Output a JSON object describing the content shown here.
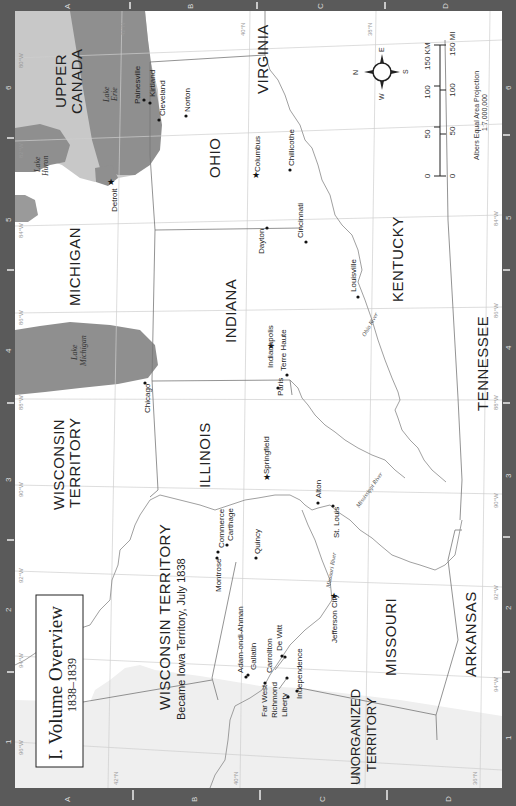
{
  "map": {
    "title": "I. Volume Overview",
    "subtitle": "1838–1839",
    "orientation": "rotated 90° counter-clockwise (north to the left)",
    "colors": {
      "frame": "#5a5a5a",
      "canada_land": "#c8c8c8",
      "water": "#8f8f8f",
      "land": "#ffffff",
      "unorganized": "#efefef",
      "grid": "#cfcfcf",
      "border": "#777777"
    },
    "frame": {
      "rows": [
        "A",
        "B",
        "C",
        "D"
      ],
      "columns": [
        "1",
        "2",
        "3",
        "4",
        "5",
        "6"
      ]
    },
    "regions": {
      "upper_canada": "UPPER CANADA",
      "michigan": "MICHIGAN",
      "ohio": "OHIO",
      "virginia": "VIRGINIA",
      "indiana": "INDIANA",
      "kentucky": "KENTUCKY",
      "tennessee": "TENNESSEE",
      "illinois": "ILLINOIS",
      "wisconsin_1": "WISCONSIN",
      "wisconsin_2": "TERRITORY",
      "iowa_1": "WISCONSIN TERRITORY",
      "iowa_2": "Became Iowa Territory, July 1838",
      "missouri": "MISSOURI",
      "arkansas": "ARKANSAS",
      "unorganized_1": "UNORGANIZED",
      "unorganized_2": "TERRITORY"
    },
    "water_labels": {
      "lake_huron_1": "Lake",
      "lake_huron_2": "Huron",
      "lake_erie_1": "Lake",
      "lake_erie_2": "Erie",
      "lake_michigan_1": "Lake",
      "lake_michigan_2": "Michigan",
      "ohio_river": "Ohio River",
      "mississippi_river": "Mississippi River",
      "missouri_river": "Missouri River"
    },
    "cities": {
      "painesville": "Painesville",
      "kirtland": "Kirtland",
      "cleveland": "Cleveland",
      "norton": "Norton",
      "detroit": "Detroit",
      "columbus": "Columbus",
      "chillicothe": "Chillicothe",
      "dayton": "Dayton",
      "cincinnati": "Cincinnati",
      "louisville": "Louisville",
      "indianapolis": "Indianapolis",
      "terre_haute": "Terre Haute",
      "paris": "Paris",
      "chicago": "Chicago",
      "springfield": "Springfield",
      "alton": "Alton",
      "st_louis": "St. Louis",
      "commerce": "Commerce",
      "carthage": "Carthage",
      "montrose": "Montrose",
      "quincy": "Quincy",
      "jefferson_city": "Jefferson City",
      "adam_ondi_ahman": "Adam-ondi-Ahman",
      "gallatin": "Gallatin",
      "carrollton": "Carrollton",
      "de_witt": "De Witt",
      "far_west": "Far West",
      "richmond": "Richmond",
      "liberty": "Liberty",
      "independence": "Independence"
    },
    "coordinates": {
      "lon_80": "80°W",
      "lon_82": "82°W",
      "lon_84": "84°W",
      "lon_86": "86°W",
      "lon_88": "88°W",
      "lon_90": "90°W",
      "lon_92": "92°W",
      "lon_94": "94°W",
      "lon_96": "96°W",
      "lat_42": "42°N",
      "lat_40": "40°N",
      "lat_38": "38°N",
      "lat_36": "36°N"
    },
    "compass": {
      "n": "N",
      "e": "E",
      "s": "S",
      "w": "W"
    },
    "scale_bar": {
      "km_label": "150 KM",
      "km_ticks": [
        "0",
        "50",
        "100"
      ],
      "mi_label": "150 MI",
      "mi_ticks": [
        "0",
        "50",
        "100"
      ],
      "projection": "Albers Equal Area Projection",
      "ratio": "1:7,000,000"
    }
  }
}
